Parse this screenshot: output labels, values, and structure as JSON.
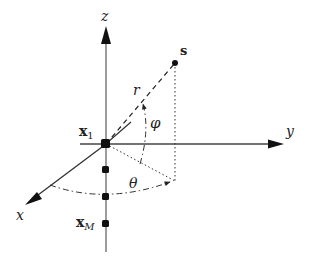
{
  "diagram": {
    "axes": {
      "x": {
        "label": "x"
      },
      "y": {
        "label": "y"
      },
      "z": {
        "label": "z"
      }
    },
    "source": {
      "label": "s"
    },
    "range": {
      "label": "r"
    },
    "angles": {
      "elevation": {
        "label": "φ"
      },
      "azimuth": {
        "label": "θ"
      }
    },
    "array": {
      "first_element": {
        "label": "x",
        "subscript": "1"
      },
      "last_element": {
        "label": "x",
        "subscript": "M"
      },
      "element_count_shown": 4
    },
    "colors": {
      "axis": "#555555",
      "line": "#222222",
      "background": "#ffffff"
    }
  }
}
